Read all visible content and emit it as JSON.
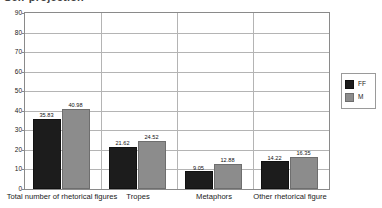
{
  "chart_data": {
    "type": "bar",
    "title": "Self-projection",
    "xlabel": "",
    "ylabel": "",
    "ylim": [
      0,
      90
    ],
    "ytick_step": 10,
    "yticks": [
      0,
      10,
      20,
      30,
      40,
      50,
      60,
      70,
      80,
      90
    ],
    "grid": true,
    "legend_position": "right",
    "categories": [
      "Total number of rhetorical figures",
      "Tropes",
      "Metaphors",
      "Other rhetorical figure"
    ],
    "series": [
      {
        "name": "FF",
        "color": "#1c1c1c",
        "values": [
          35.83,
          21.62,
          9.05,
          14.22
        ],
        "labels": [
          "35.83",
          "21.62",
          "9.05",
          "14.22"
        ]
      },
      {
        "name": "M",
        "color": "#8c8c8c",
        "values": [
          40.98,
          24.52,
          12.88,
          16.35
        ],
        "labels": [
          "40.98",
          "24.52",
          "12.88",
          "16.35"
        ]
      }
    ]
  },
  "legend": {
    "entries": [
      {
        "label": "FF",
        "color": "#1c1c1c"
      },
      {
        "label": "M",
        "color": "#8c8c8c"
      }
    ]
  },
  "colors": {
    "series_ff": "#1c1c1c",
    "series_m": "#8c8c8c",
    "gridline": "#b4b4b4",
    "axis": "#8a8a8a",
    "background": "#ffffff",
    "text": "#1a1a1a"
  }
}
